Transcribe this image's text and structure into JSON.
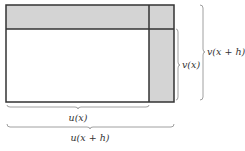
{
  "diagram": {
    "colors": {
      "shaded": "#d4d4d4",
      "stroke": "#333333",
      "background": "#ffffff",
      "brace": "#888888"
    },
    "labels": {
      "v_x": "v(x)",
      "v_x_plus_h": "v(x + h)",
      "u_x": "u(x)",
      "u_x_plus_h": "u(x + h)"
    }
  }
}
